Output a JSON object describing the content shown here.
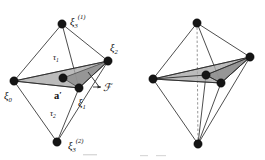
{
  "figure": {
    "background_color": "#ffffff",
    "ink_color": "#151515",
    "face_fill_color": "#a8a8a8",
    "dashed_edge_color": "#8a8a8a",
    "panels": [
      {
        "id": "left-panel",
        "name": "labelled-octahedron",
        "labels": [
          {
            "id": "xi3-upper",
            "base": "ξ",
            "sub": "3",
            "sup": "(1)",
            "x": 72,
            "y": 20,
            "role": "vertex-label"
          },
          {
            "id": "xi2",
            "base": "ξ",
            "sub": "2",
            "sup": "",
            "x": 110,
            "y": 52,
            "role": "vertex-label"
          },
          {
            "id": "xi0",
            "base": "ξ",
            "sub": "0",
            "sup": "",
            "x": 6,
            "y": 99,
            "role": "vertex-label"
          },
          {
            "id": "xi1",
            "base": "ξ",
            "sub": "1",
            "sup": "",
            "x": 81,
            "y": 105,
            "role": "vertex-label"
          },
          {
            "id": "xi3-lower",
            "base": "ξ",
            "sub": "3",
            "sup": "(2)",
            "x": 70,
            "y": 148,
            "role": "vertex-label"
          },
          {
            "id": "tau1",
            "base": "τ",
            "sub": "1",
            "sup": "",
            "x": 55,
            "y": 59,
            "role": "region-label"
          },
          {
            "id": "tau2",
            "base": "τ",
            "sub": "2",
            "sup": "",
            "x": 52,
            "y": 115,
            "role": "region-label"
          },
          {
            "id": "a-prime",
            "base": "a",
            "sub": "",
            "sup": "",
            "prime": "′",
            "x": 56,
            "y": 97,
            "role": "point-label"
          },
          {
            "id": "script-F",
            "base": "ℱ",
            "sub": "",
            "sup": "",
            "x": 104,
            "y": 90,
            "role": "face-label"
          }
        ],
        "vertices": [
          {
            "id": "v-xi3-upper",
            "name": "vertex-xi3-upper",
            "x": 62,
            "y": 24,
            "r": 4.2
          },
          {
            "id": "v-xi2",
            "name": "vertex-xi2",
            "x": 108,
            "y": 61,
            "r": 4.2
          },
          {
            "id": "v-xi0",
            "name": "vertex-xi0",
            "x": 14,
            "y": 81,
            "r": 4.2
          },
          {
            "id": "v-xi1",
            "name": "vertex-xi1",
            "x": 79,
            "y": 88,
            "r": 4.2
          },
          {
            "id": "v-a-prime",
            "name": "vertex-a-prime",
            "x": 63,
            "y": 78,
            "r": 4.2
          },
          {
            "id": "v-xi3-lower",
            "name": "vertex-xi3-lower",
            "x": 57,
            "y": 142,
            "r": 4.2
          }
        ]
      },
      {
        "id": "right-panel",
        "name": "unlabelled-octahedron-subdivided",
        "labels": [],
        "vertices": [
          {
            "id": "r-top",
            "name": "vertex-top",
            "x": 197,
            "y": 23,
            "r": 4.2
          },
          {
            "id": "r-right",
            "name": "vertex-right",
            "x": 250,
            "y": 57,
            "r": 4.2
          },
          {
            "id": "r-left",
            "name": "vertex-left",
            "x": 153,
            "y": 79,
            "r": 4.2
          },
          {
            "id": "r-front",
            "name": "vertex-front",
            "x": 221,
            "y": 83,
            "r": 4.2
          },
          {
            "id": "r-center",
            "name": "vertex-center",
            "x": 206,
            "y": 75,
            "r": 4.2
          },
          {
            "id": "r-bottom",
            "name": "vertex-bottom",
            "x": 198,
            "y": 144,
            "r": 4.2
          }
        ]
      }
    ]
  }
}
